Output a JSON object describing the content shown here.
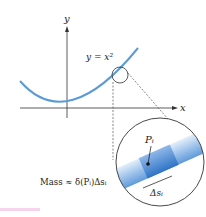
{
  "diagram": {
    "axis_y_label": "y",
    "axis_x_label": "x",
    "curve_label": "y = x²",
    "point_label": "Pᵢ",
    "segment_label": "Δsᵢ",
    "mass_formula": "Mass ≈ δ(Pᵢ)Δsᵢ",
    "colors": {
      "curve": "#5b9bd5",
      "axis": "#333333",
      "wire_light": "#cfe3f6",
      "wire_dark": "#4a8ad0",
      "caption_accent": "#f0a8d8"
    }
  }
}
